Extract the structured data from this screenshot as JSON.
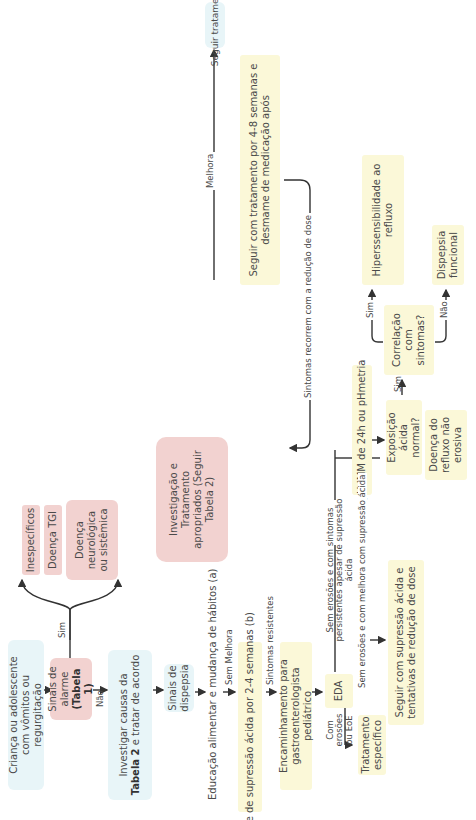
{
  "diagram": {
    "orientation": "rotated -90deg",
    "colors": {
      "blue_box": "#e8f5f8",
      "pink_box": "#f2d2d0",
      "yellow_box": "#fbf8d8",
      "line": "#333333",
      "text": "#4a4a4a"
    },
    "nodes": {
      "start": "Criança ou adolescente com vômitos ou regurgitação",
      "alarm_signs": "Sinais de alarme",
      "alarm_signs_ref": "(Tabela 1)",
      "investigate_pre": "Investigar causas da ",
      "investigate_bold": "Tabela 2",
      "investigate_post": " e tratar de acordo",
      "nonspecific": "Inespecíficos",
      "gi_disease": "Doença TGI",
      "neuro_disease": "Doença neurológica ou sistêmica",
      "appropriate_workup": "Investigação e Tratamento apropriados (Seguir Tabela 2)",
      "dyspepsia_signs": "Sinais de dispepsia",
      "diet_education": "Educação alimentar e mudança de hábitos (a)",
      "follow_treatment": "Seguir tratamento",
      "acid_suppression_trial": "Teste de supressão ácida por 2-4 semanas (b)",
      "continue_treatment": "Seguir com tratamento por 4-8 semanas e desmame de medicação após",
      "referral": "Encaminhamento para gastroenterologista pediátrico",
      "eda": "EDA",
      "specific_treatment": "Tratamento específico",
      "ph_study": "pH IMM de 24h ou pHmetria",
      "continue_suppression": "Seguir com supressão ácida e tentativas de redução de dose",
      "nerd": "Doença do refluxo não erosiva",
      "acid_exposure": "Exposição ácida normal?",
      "symptom_correlation": "Correlação com sintomas?",
      "reflux_hypersensitivity": "Hiperssensibilidade ao refluxo",
      "functional_dyspepsia": "Dispepsia funcional"
    },
    "edge_labels": {
      "yes_alarm": "Sim",
      "no_alarm": "Não",
      "improves_1": "Melhora",
      "no_improvement": "Sem Melhora",
      "improves_2": "Melhora",
      "resistant_symptoms": "Sintomas resistentes",
      "symptoms_recur": "Sintomas recorrem com a redução de dose",
      "with_erosions": "Com erosões ou EoE",
      "no_erosions_persistent": "Sem erosões e com sintomas persistentes apesar de supressão ácida",
      "no_erosions_improved": "Sem erosões e com melhora com supressão ácida",
      "acid_no": "Não",
      "acid_yes": "Sim",
      "corr_yes": "Sim",
      "corr_no": "Não"
    }
  }
}
